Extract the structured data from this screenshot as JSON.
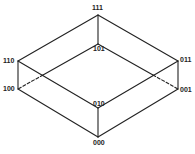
{
  "diagram": {
    "type": "cube",
    "vertices": [
      {
        "id": "v111",
        "label": "111",
        "x": 98,
        "y": 15
      },
      {
        "id": "v101",
        "label": "101",
        "x": 98,
        "y": 44
      },
      {
        "id": "v110",
        "label": "110",
        "x": 18,
        "y": 61
      },
      {
        "id": "v100",
        "label": "100",
        "x": 18,
        "y": 89
      },
      {
        "id": "v011",
        "label": "011",
        "x": 178,
        "y": 61
      },
      {
        "id": "v001",
        "label": "001",
        "x": 178,
        "y": 89
      },
      {
        "id": "v010",
        "label": "010",
        "x": 98,
        "y": 108
      },
      {
        "id": "v000",
        "label": "000",
        "x": 98,
        "y": 137
      }
    ],
    "edges": [
      {
        "from": "111",
        "to": "110",
        "style": "solid"
      },
      {
        "from": "111",
        "to": "011",
        "style": "solid"
      },
      {
        "from": "110",
        "to": "010",
        "style": "solid"
      },
      {
        "from": "011",
        "to": "010",
        "style": "solid"
      },
      {
        "from": "111",
        "to": "101",
        "style": "solid"
      },
      {
        "from": "110",
        "to": "100",
        "style": "solid"
      },
      {
        "from": "011",
        "to": "001",
        "style": "solid"
      },
      {
        "from": "010",
        "to": "000",
        "style": "solid"
      },
      {
        "from": "100",
        "to": "000",
        "style": "solid"
      },
      {
        "from": "001",
        "to": "000",
        "style": "solid"
      },
      {
        "from": "101",
        "to": "100",
        "style": "solid-then-dashed"
      },
      {
        "from": "101",
        "to": "001",
        "style": "solid-then-dashed"
      }
    ]
  },
  "labels": {
    "l111": "111",
    "l101": "101",
    "l110": "110",
    "l100": "100",
    "l011": "011",
    "l001": "001",
    "l010": "010",
    "l000": "000"
  },
  "colors": {
    "line": "#222222",
    "background": "#ffffff"
  }
}
